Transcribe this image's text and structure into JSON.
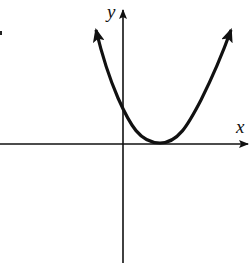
{
  "diagram": {
    "type": "graph of function",
    "axes": {
      "x_label": "x",
      "y_label": "y"
    },
    "curve": {
      "kind": "parabola",
      "opens": "up",
      "vertex_position": "on positive x-axis",
      "y_intercept": "positive",
      "end_arrows": true
    },
    "colors": {
      "ink": "#111111",
      "background": "#ffffff"
    }
  }
}
